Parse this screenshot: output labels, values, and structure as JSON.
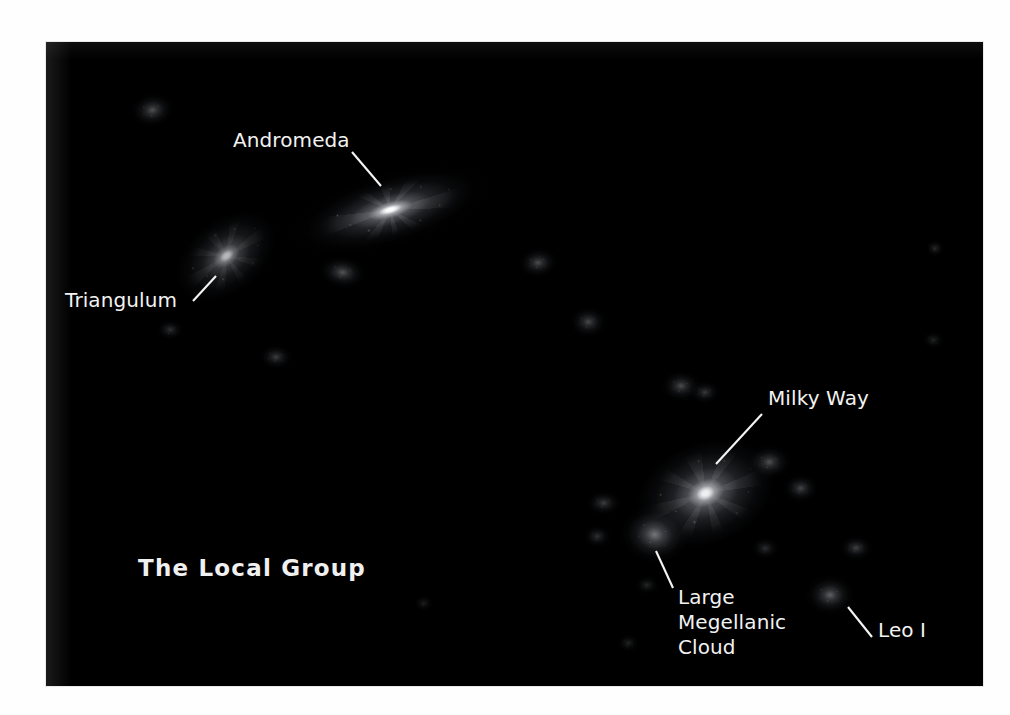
{
  "figure": {
    "title": "The Local Group",
    "background_color": "#ffffff",
    "sky_color": "#000000",
    "label_color": "#f2f2f2"
  },
  "title_block": {
    "text": "The Local Group",
    "x": 138,
    "y": 555
  },
  "labels": [
    {
      "id": "andromeda",
      "text": "Andromeda",
      "x": 233,
      "y": 128,
      "leader": {
        "x1": 352,
        "y1": 152,
        "x2": 381,
        "y2": 186
      }
    },
    {
      "id": "triangulum",
      "text": "Triangulum",
      "x": 65,
      "y": 288,
      "leader": {
        "x1": 193,
        "y1": 301,
        "x2": 216,
        "y2": 276
      }
    },
    {
      "id": "milky-way",
      "text": "Milky Way",
      "x": 768,
      "y": 386,
      "leader": {
        "x1": 762,
        "y1": 414,
        "x2": 716,
        "y2": 464
      }
    },
    {
      "id": "large-megellanic-cloud",
      "text": "Large\nMegellanic\nCloud",
      "x": 678,
      "y": 585,
      "leader": {
        "x1": 656,
        "y1": 551,
        "x2": 673,
        "y2": 588
      }
    },
    {
      "id": "leo-i",
      "text": "Leo I",
      "x": 878,
      "y": 618,
      "leader": {
        "x1": 848,
        "y1": 607,
        "x2": 872,
        "y2": 637
      }
    }
  ],
  "galaxies": [
    {
      "id": "andromeda",
      "name": "Andromeda",
      "type": "spiral",
      "x": 390,
      "y": 210,
      "w": 96,
      "h": 34,
      "rot": -16,
      "brightness": 1.0
    },
    {
      "id": "triangulum",
      "name": "Triangulum",
      "type": "spiral",
      "x": 226,
      "y": 256,
      "w": 62,
      "h": 40,
      "rot": -38,
      "brightness": 0.72
    },
    {
      "id": "milky-way",
      "name": "Milky Way",
      "type": "spiral",
      "x": 706,
      "y": 493,
      "w": 78,
      "h": 56,
      "rot": -22,
      "brightness": 0.94
    },
    {
      "id": "lmc",
      "name": "Large Megellanic Cloud",
      "type": "dwarf",
      "x": 655,
      "y": 535,
      "w": 34,
      "h": 28,
      "rot": 10,
      "brightness": 0.62
    },
    {
      "id": "leo-i",
      "name": "Leo I",
      "type": "dwarf",
      "x": 830,
      "y": 595,
      "w": 24,
      "h": 20,
      "rot": 0,
      "brightness": 0.5
    },
    {
      "id": "dwarf-01",
      "name": "dwarf galaxy",
      "type": "dwarf",
      "x": 152,
      "y": 110,
      "w": 22,
      "h": 17,
      "rot": -12,
      "brightness": 0.42
    },
    {
      "id": "dwarf-02",
      "name": "dwarf galaxy",
      "type": "dwarf",
      "x": 343,
      "y": 272,
      "w": 24,
      "h": 16,
      "rot": 8,
      "brightness": 0.44
    },
    {
      "id": "dwarf-03",
      "name": "dwarf galaxy",
      "type": "dwarf",
      "x": 538,
      "y": 262,
      "w": 20,
      "h": 15,
      "rot": -6,
      "brightness": 0.4
    },
    {
      "id": "dwarf-04",
      "name": "dwarf galaxy",
      "type": "dwarf",
      "x": 588,
      "y": 322,
      "w": 19,
      "h": 16,
      "rot": 0,
      "brightness": 0.38
    },
    {
      "id": "dwarf-05",
      "name": "dwarf galaxy",
      "type": "dwarf",
      "x": 276,
      "y": 357,
      "w": 17,
      "h": 13,
      "rot": 0,
      "brightness": 0.32
    },
    {
      "id": "dwarf-06",
      "name": "dwarf galaxy",
      "type": "dwarf",
      "x": 170,
      "y": 330,
      "w": 14,
      "h": 11,
      "rot": 0,
      "brightness": 0.26
    },
    {
      "id": "dwarf-07",
      "name": "dwarf galaxy",
      "type": "dwarf",
      "x": 681,
      "y": 386,
      "w": 20,
      "h": 16,
      "rot": 0,
      "brightness": 0.4
    },
    {
      "id": "dwarf-08",
      "name": "dwarf galaxy",
      "type": "dwarf",
      "x": 705,
      "y": 392,
      "w": 16,
      "h": 12,
      "rot": 0,
      "brightness": 0.3
    },
    {
      "id": "dwarf-09",
      "name": "dwarf galaxy",
      "type": "dwarf",
      "x": 769,
      "y": 462,
      "w": 22,
      "h": 17,
      "rot": 0,
      "brightness": 0.42
    },
    {
      "id": "dwarf-10",
      "name": "dwarf galaxy",
      "type": "dwarf",
      "x": 801,
      "y": 488,
      "w": 18,
      "h": 15,
      "rot": 0,
      "brightness": 0.36
    },
    {
      "id": "dwarf-11",
      "name": "dwarf galaxy",
      "type": "dwarf",
      "x": 604,
      "y": 503,
      "w": 18,
      "h": 13,
      "rot": 0,
      "brightness": 0.32
    },
    {
      "id": "dwarf-12",
      "name": "dwarf galaxy",
      "type": "dwarf",
      "x": 597,
      "y": 536,
      "w": 15,
      "h": 12,
      "rot": 0,
      "brightness": 0.26
    },
    {
      "id": "dwarf-13",
      "name": "dwarf galaxy",
      "type": "dwarf",
      "x": 765,
      "y": 548,
      "w": 15,
      "h": 12,
      "rot": 0,
      "brightness": 0.24
    },
    {
      "id": "dwarf-14",
      "name": "dwarf galaxy",
      "type": "dwarf",
      "x": 647,
      "y": 585,
      "w": 13,
      "h": 10,
      "rot": 0,
      "brightness": 0.2
    },
    {
      "id": "dwarf-15",
      "name": "dwarf galaxy",
      "type": "dwarf",
      "x": 856,
      "y": 548,
      "w": 17,
      "h": 13,
      "rot": 0,
      "brightness": 0.34
    },
    {
      "id": "dwarf-16",
      "name": "dwarf galaxy",
      "type": "dwarf",
      "x": 935,
      "y": 248,
      "w": 10,
      "h": 9,
      "rot": 0,
      "brightness": 0.22
    },
    {
      "id": "dwarf-17",
      "name": "dwarf galaxy",
      "type": "dwarf",
      "x": 933,
      "y": 340,
      "w": 12,
      "h": 10,
      "rot": 0,
      "brightness": 0.18
    },
    {
      "id": "dwarf-18",
      "name": "dwarf galaxy",
      "type": "dwarf",
      "x": 628,
      "y": 643,
      "w": 12,
      "h": 10,
      "rot": 0,
      "brightness": 0.18
    },
    {
      "id": "dwarf-19",
      "name": "dwarf galaxy",
      "type": "dwarf",
      "x": 424,
      "y": 603,
      "w": 11,
      "h": 9,
      "rot": 0,
      "brightness": 0.16
    }
  ]
}
